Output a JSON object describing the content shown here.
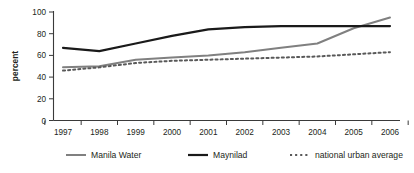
{
  "chart_data": {
    "type": "line",
    "title": "",
    "subtitle": "",
    "xlabel": "",
    "ylabel": "percent",
    "categories": [
      "1997",
      "1998",
      "1999",
      "2000",
      "2001",
      "2002",
      "2003",
      "2004",
      "2005",
      "2006"
    ],
    "ylim": [
      0,
      100
    ],
    "yticks": [
      0,
      20,
      40,
      60,
      80,
      100
    ],
    "ytick_labels": [
      "0",
      "20",
      "40",
      "60",
      "80",
      "100"
    ],
    "grid": false,
    "legend_position": "bottom",
    "series": [
      {
        "name": "Manila Water",
        "values": [
          49,
          50,
          56,
          58,
          60,
          63,
          67,
          71,
          85,
          95
        ],
        "color": "#808080",
        "style": "solid",
        "width": 2.0
      },
      {
        "name": "Maynilad",
        "values": [
          67,
          64,
          71,
          78,
          84,
          86,
          87,
          87,
          87,
          87
        ],
        "color": "#1a1a1a",
        "style": "solid",
        "width": 2.2
      },
      {
        "name": "national urban average",
        "values": [
          46,
          49,
          53,
          55,
          56,
          57,
          58,
          59,
          61,
          63
        ],
        "color": "#595959",
        "style": "dotted",
        "width": 2.0
      }
    ]
  },
  "axis": {
    "y_label": "percent",
    "y_tick_labels": [
      "100",
      "80",
      "60",
      "40",
      "20",
      "0"
    ],
    "x_tick_labels": [
      "1997",
      "1998",
      "1999",
      "2000",
      "2001",
      "2002",
      "2003",
      "2004",
      "2005",
      "2006"
    ]
  },
  "legend": {
    "items": [
      {
        "label": "Manila Water",
        "color": "#808080",
        "style": "solid"
      },
      {
        "label": "Maynilad",
        "color": "#1a1a1a",
        "style": "solid"
      },
      {
        "label": "national urban average",
        "color": "#595959",
        "style": "dotted"
      }
    ]
  }
}
